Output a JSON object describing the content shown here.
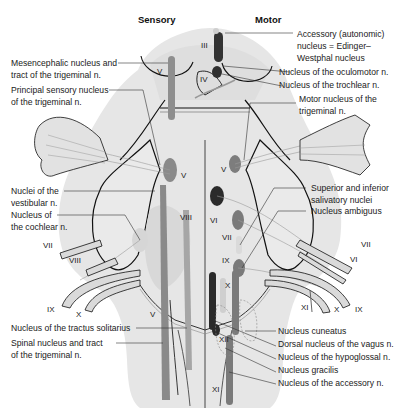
{
  "headers": {
    "sensory": "Sensory",
    "motor": "Motor"
  },
  "colors": {
    "brainstem_fill": "#e4e4e4",
    "region_fill": "#ececec",
    "outline": "#111111",
    "sensory_nucleus": "#8a8a8a",
    "motor_nucleus": "#7a7a7a",
    "dark_nucleus": "#2b2b2b",
    "light_nucleus": "#d0d0d0",
    "nerve_fill": "#d8d8d8"
  },
  "labels_left": [
    {
      "text1": "Mesencephalic nucleus and",
      "text2": "tract of the trigeminal n."
    },
    {
      "text1": "Principal sensory nucleus",
      "text2": "of the trigeminal n."
    },
    {
      "text1": "Nuclei of the",
      "text2": "vestibular n."
    },
    {
      "text1": "Nucleus of",
      "text2": "the cochlear n."
    },
    {
      "text1": "Nucleus of the tractus solitarius",
      "text2": ""
    },
    {
      "text1": "Spinal nucleus and tract",
      "text2": "of the trigeminal n."
    }
  ],
  "labels_right": [
    {
      "text1": "Accessory (autonomic)",
      "text2": "nucleus = Edinger–",
      "text3": "Westphal nucleus"
    },
    {
      "text1": "Nucleus of the oculomotor n."
    },
    {
      "text1": "Nucleus of the trochlear n."
    },
    {
      "text1": "Motor nucleus of the",
      "text2": "trigeminal n."
    },
    {
      "text1": "Superior and inferior",
      "text2": "salivatory nuclei"
    },
    {
      "text1": "Nucleus ambiguus"
    },
    {
      "text1": "Nucleus cuneatus"
    },
    {
      "text1": "Dorsal nucleus of the vagus n."
    },
    {
      "text1": "Nucleus of the hypoglossal n."
    },
    {
      "text1": "Nucleus gracilis"
    },
    {
      "text1": "Nucleus of the accessory n."
    }
  ],
  "cranial_nerve_marks": {
    "iii": "III",
    "iv": "IV",
    "v": "V",
    "vi": "VI",
    "vii": "VII",
    "viii": "VIII",
    "ix": "IX",
    "x": "X",
    "xi": "XI",
    "xii": "XII"
  }
}
